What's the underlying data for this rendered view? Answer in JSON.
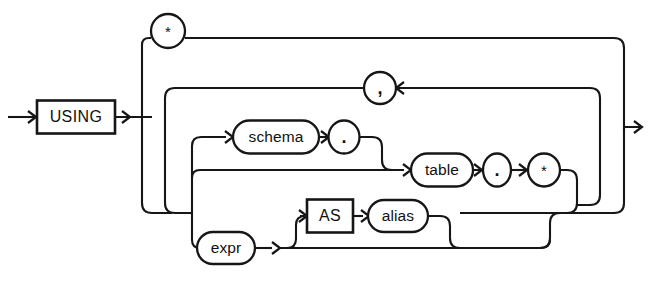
{
  "diagram": {
    "type": "railroad-syntax-diagram",
    "stroke_color": "#161616",
    "background_color": "#ffffff",
    "nodes": [
      {
        "id": "using",
        "label": "USING",
        "shape": "rectangle",
        "kind": "keyword",
        "cx": 76,
        "cy": 117,
        "w": 78,
        "h": 33
      },
      {
        "id": "star1",
        "label": "*",
        "shape": "circle",
        "kind": "punct",
        "cx": 168,
        "cy": 31,
        "w": 34,
        "h": 34
      },
      {
        "id": "comma",
        "label": ",",
        "shape": "circle",
        "kind": "punct",
        "cx": 380,
        "cy": 88,
        "w": 31,
        "h": 31
      },
      {
        "id": "schema",
        "label": "schema",
        "shape": "stadium",
        "kind": "nonterm",
        "cx": 276,
        "cy": 137,
        "w": 86,
        "h": 33
      },
      {
        "id": "dot1",
        "label": ".",
        "shape": "circle",
        "kind": "punct",
        "cx": 344,
        "cy": 137,
        "w": 31,
        "h": 33
      },
      {
        "id": "table",
        "label": "table",
        "shape": "stadium",
        "kind": "nonterm",
        "cx": 442,
        "cy": 170,
        "w": 62,
        "h": 33
      },
      {
        "id": "dot2",
        "label": ".",
        "shape": "circle",
        "kind": "punct",
        "cx": 497,
        "cy": 170,
        "w": 27,
        "h": 33
      },
      {
        "id": "star2",
        "label": "*",
        "shape": "circle",
        "kind": "punct",
        "cx": 544,
        "cy": 170,
        "w": 32,
        "h": 33
      },
      {
        "id": "as",
        "label": "AS",
        "shape": "rectangle",
        "kind": "keyword",
        "cx": 330,
        "cy": 216,
        "w": 46,
        "h": 33
      },
      {
        "id": "alias",
        "label": "alias",
        "shape": "stadium",
        "kind": "nonterm",
        "cx": 398,
        "cy": 216,
        "w": 60,
        "h": 32
      },
      {
        "id": "expr",
        "label": "expr",
        "shape": "stadium",
        "kind": "nonterm",
        "cx": 226,
        "cy": 248,
        "w": 58,
        "h": 32
      }
    ],
    "terminals": [
      "USING",
      "AS"
    ],
    "nonterminals": [
      "schema",
      "table",
      "alias",
      "expr"
    ],
    "punctuation": [
      "*",
      ",",
      ".",
      ".",
      "*"
    ],
    "entry_label": "entry-arrow",
    "exit_label": "exit-arrow",
    "grammar": "USING { * | { [ schema . ] table . * | expr [ AS alias ] } [ , ... ] }"
  }
}
